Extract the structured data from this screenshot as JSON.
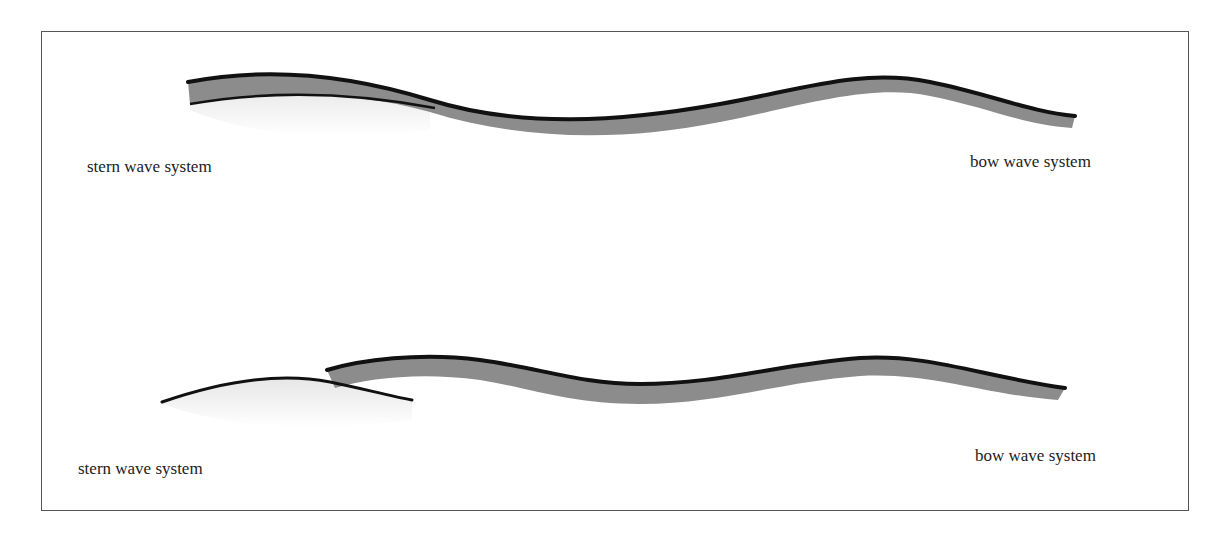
{
  "figure": {
    "panels": [
      {
        "id": "top",
        "stern_label": "stern wave system",
        "bow_label": "bow wave system"
      },
      {
        "id": "bottom",
        "stern_label": "stern wave system",
        "bow_label": "bow wave system"
      }
    ]
  },
  "colors": {
    "frame": "#555555",
    "wave_edge": "#111111",
    "bow_fill": "#8a8a8a",
    "stern_fill": "#e8e8e8"
  }
}
